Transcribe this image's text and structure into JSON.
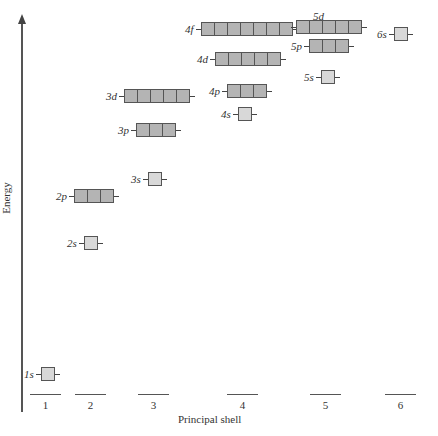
{
  "diagram": {
    "y_axis_label": "Energy",
    "x_axis_label": "Principal shell",
    "shells": [
      "1",
      "2",
      "3",
      "4",
      "5",
      "6"
    ],
    "orbitals": [
      {
        "label": "1s",
        "boxes": 1
      },
      {
        "label": "2s",
        "boxes": 1
      },
      {
        "label": "2p",
        "boxes": 3
      },
      {
        "label": "3s",
        "boxes": 1
      },
      {
        "label": "3p",
        "boxes": 3
      },
      {
        "label": "3d",
        "boxes": 5
      },
      {
        "label": "4s",
        "boxes": 1
      },
      {
        "label": "4p",
        "boxes": 3
      },
      {
        "label": "4d",
        "boxes": 5
      },
      {
        "label": "4f",
        "boxes": 7
      },
      {
        "label": "5s",
        "boxes": 1
      },
      {
        "label": "5p",
        "boxes": 3
      },
      {
        "label": "5d",
        "boxes": 5
      },
      {
        "label": "6s",
        "boxes": 1
      }
    ],
    "colors": {
      "s_box": "#d8d8d8",
      "pdf_box": "#b4b4b4",
      "outline": "#555555"
    }
  }
}
